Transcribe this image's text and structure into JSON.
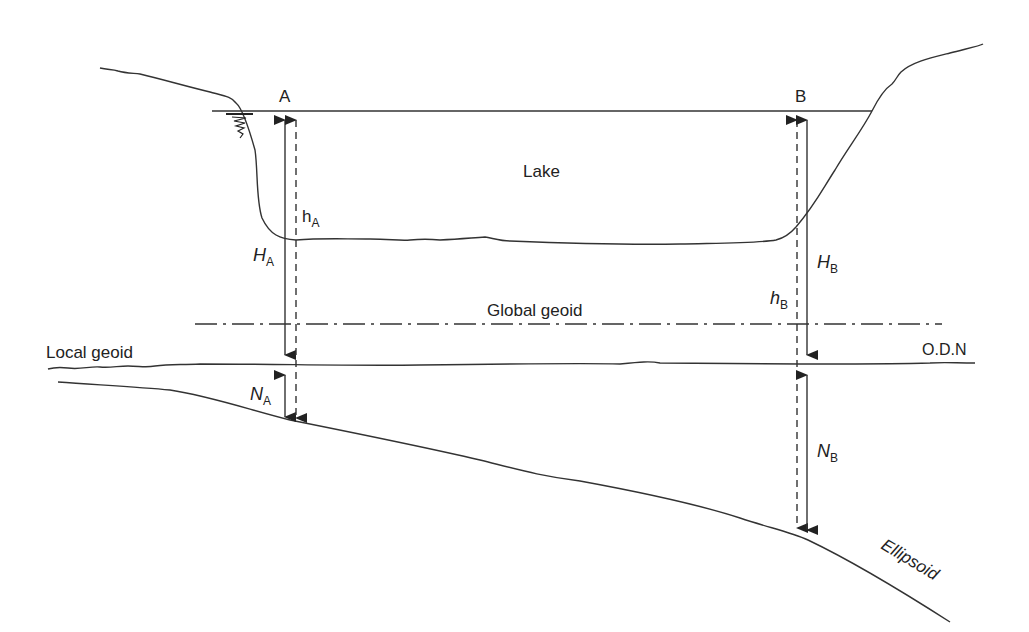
{
  "diagram": {
    "points": {
      "a": {
        "label": "A"
      },
      "b": {
        "label": "B"
      }
    },
    "regions": {
      "lake": "Lake"
    },
    "surfaces": {
      "global_geoid": "Global geoid",
      "local_geoid": "Local geoid",
      "odn": "O.D.N",
      "ellipsoid": "Ellipsoid"
    },
    "measurements": {
      "h_a": {
        "symbol": "h",
        "subscript": "A"
      },
      "H_a": {
        "symbol": "H",
        "subscript": "A"
      },
      "N_a": {
        "symbol": "N",
        "subscript": "A"
      },
      "h_b": {
        "symbol": "h",
        "subscript": "B"
      },
      "H_b": {
        "symbol": "H",
        "subscript": "B"
      },
      "N_b": {
        "symbol": "N",
        "subscript": "B"
      }
    },
    "colors": {
      "stroke": "#333333",
      "text": "#222222",
      "background": "#ffffff"
    }
  }
}
